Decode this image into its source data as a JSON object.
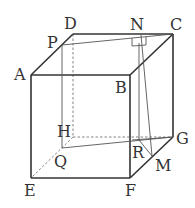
{
  "figure": {
    "type": "cube",
    "labels": {
      "A": "A",
      "B": "B",
      "C": "C",
      "D": "D",
      "E": "E",
      "F": "F",
      "G": "G",
      "H": "H",
      "P": "P",
      "Q": "Q",
      "N": "N",
      "R": "R",
      "M": "M"
    },
    "right_angle_mark_at": "N"
  }
}
